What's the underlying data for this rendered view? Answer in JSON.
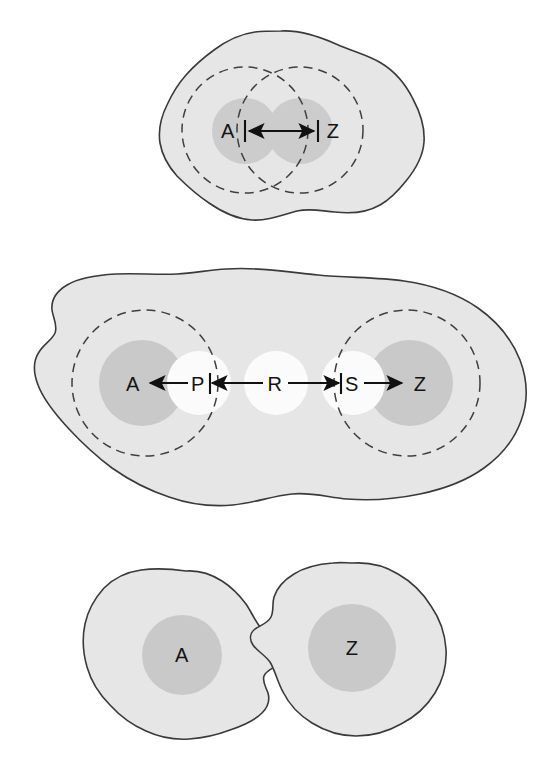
{
  "figure": {
    "title": "",
    "background_color": "#ffffff",
    "colors": {
      "blob_fill": "#e6e6e6",
      "blob_outline": "#3a3a3a",
      "core_fill": "#c9c9c9",
      "white_circle_fill": "#fbfbfb",
      "dashed_stroke": "#3f3f3f",
      "arrow_color": "#111111",
      "label_color": "#141414"
    }
  },
  "panels": [
    {
      "id": "top",
      "name": "overlapping-ranges-panel",
      "description": "Single irregular blob containing two overlapping dashed circles with two gray cores labelled A and Z joined by a double headed arrow",
      "labels": [
        {
          "id": "A",
          "text": "A",
          "x": 228,
          "y": 131
        },
        {
          "id": "Z",
          "text": "Z",
          "x": 333,
          "y": 131
        }
      ],
      "dashed_circles": [
        {
          "cx": 245,
          "cy": 130,
          "r": 63
        },
        {
          "cx": 300,
          "cy": 130,
          "r": 63
        }
      ],
      "cores": [
        {
          "cx": 245,
          "cy": 131,
          "r": 33
        },
        {
          "cx": 300,
          "cy": 131,
          "r": 33
        }
      ],
      "arrows": [
        {
          "from": "A",
          "to": "Z",
          "x1": 245,
          "x2": 318,
          "y": 131,
          "heads": "both"
        }
      ],
      "tick_bars": [
        {
          "x": 245,
          "y1": 120,
          "y2": 142
        },
        {
          "x": 318,
          "y1": 120,
          "y2": 142
        }
      ]
    },
    {
      "id": "middle",
      "name": "relay-chain-panel",
      "description": "Large irregular blob with two dashed circles at the ends, gray cores A and Z, and a chain of white relay circles P, R, S connected by arrows",
      "labels": [
        {
          "id": "A",
          "text": "A",
          "x": 133,
          "y": 384
        },
        {
          "id": "P",
          "text": "P",
          "x": 198,
          "y": 384
        },
        {
          "id": "R",
          "text": "R",
          "x": 275,
          "y": 384
        },
        {
          "id": "S",
          "text": "S",
          "x": 352,
          "y": 384
        },
        {
          "id": "Z",
          "text": "Z",
          "x": 420,
          "y": 384
        }
      ],
      "dashed_circles": [
        {
          "cx": 145,
          "cy": 383,
          "r": 73
        },
        {
          "cx": 407,
          "cy": 383,
          "r": 73
        }
      ],
      "cores": [
        {
          "cx": 142,
          "cy": 383,
          "r": 43
        },
        {
          "cx": 410,
          "cy": 383,
          "r": 43
        }
      ],
      "white_circles": [
        {
          "cx": 199,
          "cy": 383,
          "r": 32
        },
        {
          "cx": 276,
          "cy": 383,
          "r": 32
        },
        {
          "cx": 353,
          "cy": 383,
          "r": 32
        }
      ],
      "arrows": [
        {
          "from": "P",
          "to": "A",
          "x1": 188,
          "x2": 147,
          "y": 383,
          "heads": "end"
        },
        {
          "from": "R",
          "to": "P",
          "x1": 263,
          "x2": 209,
          "y": 383,
          "heads": "end"
        },
        {
          "from": "R",
          "to": "S",
          "x1": 288,
          "x2": 342,
          "y": 383,
          "heads": "end"
        },
        {
          "from": "S",
          "to": "Z",
          "x1": 364,
          "x2": 405,
          "y": 383,
          "heads": "end"
        }
      ],
      "tick_bars": [
        {
          "x": 210,
          "y1": 373,
          "y2": 394
        },
        {
          "x": 341,
          "y1": 373,
          "y2": 394
        }
      ]
    },
    {
      "id": "bottom",
      "name": "separate-domains-panel",
      "description": "Two separate irregular blobs each containing a single gray core, labelled A and Z",
      "labels": [
        {
          "id": "A",
          "text": "A",
          "x": 182,
          "y": 655
        },
        {
          "id": "Z",
          "text": "Z",
          "x": 352,
          "y": 648
        }
      ],
      "cores": [
        {
          "cx": 182,
          "cy": 655,
          "r": 40
        },
        {
          "cx": 352,
          "cy": 648,
          "r": 44
        }
      ]
    }
  ]
}
